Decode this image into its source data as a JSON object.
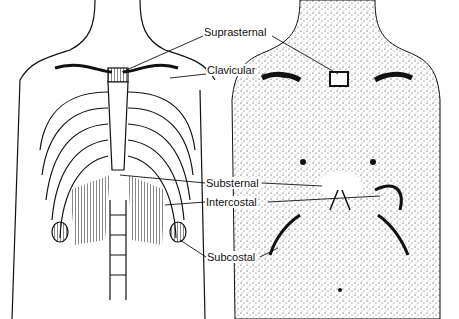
{
  "diagram": {
    "panels": [
      {
        "name": "skeletal-view",
        "description": "Rib cage and sternum"
      },
      {
        "name": "surface-view",
        "description": "Stippled torso surface"
      }
    ],
    "labels": [
      {
        "id": "suprasternal",
        "text": "Suprasternal",
        "x": 203,
        "y": 32
      },
      {
        "id": "clavicular",
        "text": "Clavicular",
        "x": 206,
        "y": 70
      },
      {
        "id": "substernal",
        "text": "Substernal",
        "x": 205,
        "y": 179
      },
      {
        "id": "intercostal",
        "text": "Intercostal",
        "x": 205,
        "y": 198
      },
      {
        "id": "subcostal",
        "text": "Subcostal",
        "x": 206,
        "y": 253
      }
    ],
    "colors": {
      "ink": "#111111",
      "background": "#ffffff"
    }
  }
}
